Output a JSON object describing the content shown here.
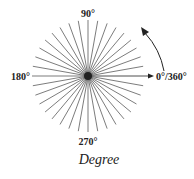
{
  "diagram": {
    "center": [
      88,
      76
    ],
    "radius": 56,
    "ray_count": 36,
    "ray_color": "#333333",
    "labels": {
      "top": "90°",
      "left": "180°",
      "bottom": "270°",
      "right": "0°/360°"
    },
    "caption": "Degree",
    "arrow": "counterclockwise-direction"
  }
}
